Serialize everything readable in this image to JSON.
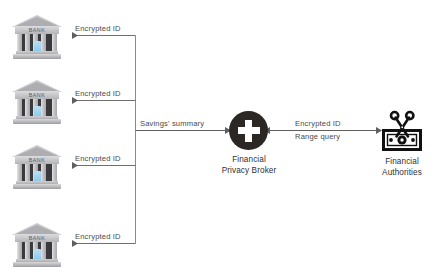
{
  "diagram": {
    "colors": {
      "line": "#6b6b6b",
      "broker_fill": "#2b2724",
      "broker_glyph": "#ffffff",
      "authority_fill": "#111111",
      "bank_body": "#c3c3c6",
      "bank_door": "#8fc9ea",
      "label_text": "#3b3b3b"
    },
    "banks": [
      {
        "id": "bank-1",
        "icon": "bank-building-icon",
        "caption": "BANK",
        "edge_label": "Encrypted ID"
      },
      {
        "id": "bank-2",
        "icon": "bank-building-icon",
        "caption": "BANK",
        "edge_label": "Encrypted ID"
      },
      {
        "id": "bank-3",
        "icon": "bank-building-icon",
        "caption": "BANK",
        "edge_label": "Encrypted ID"
      },
      {
        "id": "bank-4",
        "icon": "bank-building-icon",
        "caption": "BANK",
        "edge_label": "Encrypted ID"
      }
    ],
    "broker": {
      "icon": "plus-circle-icon",
      "caption_line1": "Financial",
      "caption_line2": "Privacy Broker"
    },
    "authorities": {
      "icon": "banknote-scissors-icon",
      "caption_line1": "Financial",
      "caption_line2": "Authorities"
    },
    "edges": {
      "savings_summary": "Savings' summary",
      "broker_authority_line1": "Encrypted ID",
      "broker_authority_line2": "Range query"
    }
  }
}
